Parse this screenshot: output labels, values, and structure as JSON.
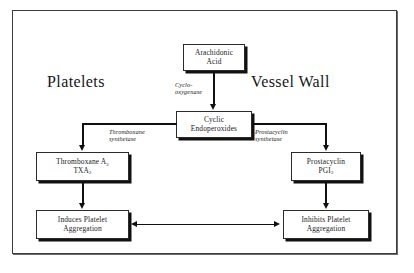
{
  "diagram": {
    "type": "flowchart",
    "headings": {
      "left": "Platelets",
      "right": "Vessel Wall"
    },
    "nodes": {
      "arachidonic": {
        "line1": "Arachidonic",
        "line2": "Acid"
      },
      "cyclic": {
        "line1": "Cyclic",
        "line2": "Endoperoxides"
      },
      "thromboxane": {
        "line1_text": "Thromboxane A",
        "line1_sub": "2",
        "line2_text": "TXA",
        "line2_sub": "2"
      },
      "prostacyclin": {
        "line1_text": "Prostacyclin",
        "line2_text": "PGI",
        "line2_sub": "2"
      },
      "induces": {
        "line1": "Induces Platelet",
        "line2": "Aggregation"
      },
      "inhibits": {
        "line1": "Inhibits Platelet",
        "line2": "Aggregation"
      }
    },
    "enzymes": {
      "cyclooxygenase": {
        "line1": "Cyclo-",
        "line2": "oxygenase"
      },
      "thromboxane_synthetase": {
        "line1": "Thromboxane",
        "line2": "synthetase"
      },
      "prostacyclin_synthetase": {
        "line1": "Prostacyclin",
        "line2": "synthetase"
      }
    },
    "colors": {
      "ink": "#101010",
      "box_border": "#2b2b2b",
      "box_shadow": "#111111",
      "frame_border": "#3c3c3c",
      "background": "#ffffff"
    }
  }
}
